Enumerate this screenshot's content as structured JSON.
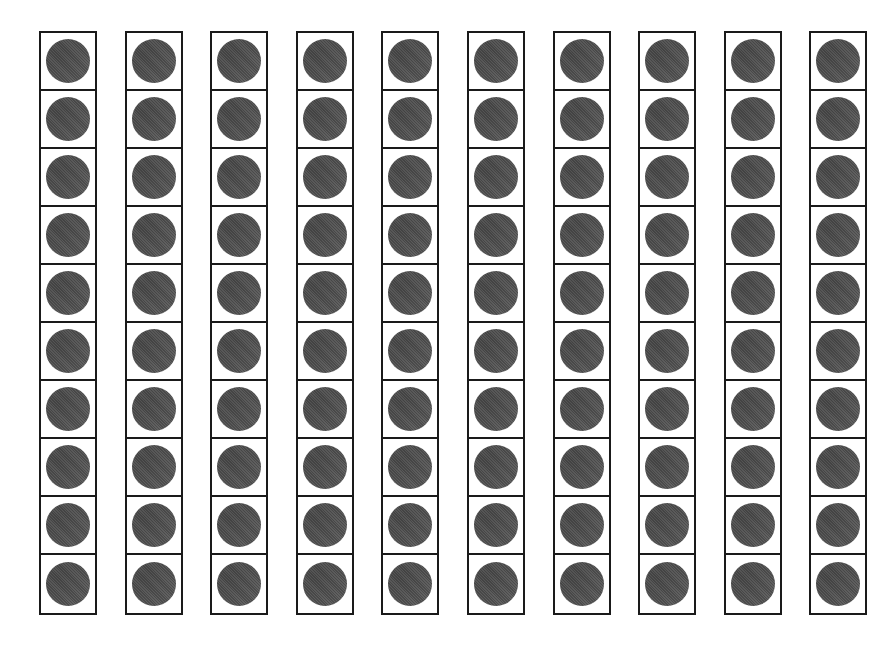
{
  "figure": {
    "frame_count": 10,
    "cells_per_frame": 10,
    "filled_per_frame": [
      10,
      10,
      10,
      10,
      10,
      10,
      10,
      10,
      10,
      10
    ],
    "total_counters": 100,
    "colors": {
      "border": "#1a1a1a",
      "counter": "#575757",
      "background": "#ffffff"
    }
  }
}
